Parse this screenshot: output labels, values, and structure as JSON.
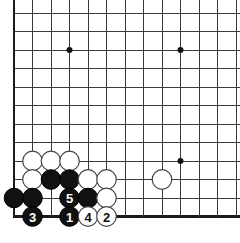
{
  "diagram": {
    "type": "go-board-corner",
    "board": {
      "width_px": 240,
      "height_px": 243,
      "origin_x": 14,
      "origin_y": 13,
      "spacing": 18.5,
      "cols": 13,
      "rows": 12,
      "left_edge": true,
      "bottom_edge": true,
      "top_edge": false,
      "right_edge": false,
      "grid_color": "#3a3a3a",
      "edge_color": "#1a1a1a",
      "background": "#ffffff"
    },
    "star_points": [
      {
        "name": "star-point-upper-left",
        "col": 3,
        "row": 2
      },
      {
        "name": "star-point-upper-right",
        "col": 9,
        "row": 2
      },
      {
        "name": "star-point-lower-right",
        "col": 9,
        "row": 8
      }
    ],
    "stones": [
      {
        "name": "white-stone-a",
        "color": "white",
        "col": 1,
        "row": 8,
        "label": ""
      },
      {
        "name": "white-stone-b",
        "color": "white",
        "col": 2,
        "row": 8,
        "label": ""
      },
      {
        "name": "white-stone-c",
        "color": "white",
        "col": 3,
        "row": 8,
        "label": ""
      },
      {
        "name": "white-stone-d",
        "color": "white",
        "col": 1,
        "row": 9,
        "label": ""
      },
      {
        "name": "black-stone-a",
        "color": "black",
        "col": 2,
        "row": 9,
        "label": ""
      },
      {
        "name": "black-stone-b",
        "color": "black",
        "col": 3,
        "row": 9,
        "label": ""
      },
      {
        "name": "white-stone-e",
        "color": "white",
        "col": 4,
        "row": 9,
        "label": ""
      },
      {
        "name": "white-stone-f",
        "color": "white",
        "col": 5,
        "row": 9,
        "label": ""
      },
      {
        "name": "white-stone-lone",
        "color": "white",
        "col": 8,
        "row": 9,
        "label": ""
      },
      {
        "name": "black-stone-c",
        "color": "black",
        "col": 0,
        "row": 10,
        "label": ""
      },
      {
        "name": "black-stone-d",
        "color": "black",
        "col": 1,
        "row": 10,
        "label": ""
      },
      {
        "name": "black-move-5",
        "color": "black",
        "col": 3,
        "row": 10,
        "label": "5"
      },
      {
        "name": "black-stone-e",
        "color": "black",
        "col": 4,
        "row": 10,
        "label": ""
      },
      {
        "name": "white-stone-g",
        "color": "white",
        "col": 5,
        "row": 10,
        "label": ""
      },
      {
        "name": "black-move-3",
        "color": "black",
        "col": 1,
        "row": 11,
        "label": "3"
      },
      {
        "name": "black-move-1",
        "color": "black",
        "col": 3,
        "row": 11,
        "label": "1"
      },
      {
        "name": "white-move-4",
        "color": "white",
        "col": 4,
        "row": 11,
        "label": "4"
      },
      {
        "name": "white-move-2",
        "color": "white",
        "col": 5,
        "row": 11,
        "label": "2"
      }
    ],
    "move_sequence": [
      "1",
      "2",
      "3",
      "4",
      "5"
    ]
  }
}
